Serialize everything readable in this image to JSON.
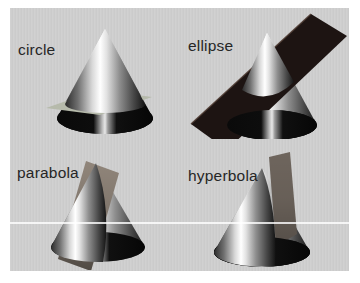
{
  "figure": {
    "panels": [
      {
        "id": "circle",
        "label": "circle"
      },
      {
        "id": "ellipse",
        "label": "ellipse"
      },
      {
        "id": "parabola",
        "label": "parabola"
      },
      {
        "id": "hyperbola",
        "label": "hyperbola"
      }
    ],
    "colors": {
      "page_background": "#ffffff",
      "panel_background": "#cfcfcf",
      "label_text": "#262626",
      "cone_shadow_base": "#0b0b0b",
      "cone_highlight": "#ffffff",
      "plane_circle": "#b6baab",
      "plane_ellipse": "#1d1412",
      "plane_ellipse_edge": "#4a372e",
      "plane_parabola": "#90857a",
      "plane_hyperbola": "#6e655d",
      "artifact_line": "#f2f2f2"
    }
  }
}
